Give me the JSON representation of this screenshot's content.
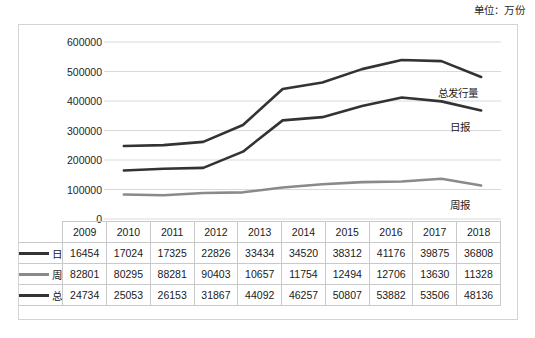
{
  "unit_note": "单位：万份",
  "chart_data": {
    "type": "line",
    "title": "",
    "xlabel": "",
    "ylabel": "",
    "ylim": [
      0,
      600000
    ],
    "ytick_step": 100000,
    "ytick_labels": [
      "600000",
      "500000",
      "400000",
      "300000",
      "200000",
      "100000",
      "0"
    ],
    "grid": true,
    "legend_position": "data-table-below",
    "unit": "万份",
    "categories": [
      "2009",
      "2010",
      "2011",
      "2012",
      "2013",
      "2014",
      "2015",
      "2016",
      "2017",
      "2018"
    ],
    "series": [
      {
        "name": "日报",
        "color": "#333333",
        "values": [
          16454,
          17024,
          17325,
          22826,
          33434,
          34520,
          38312,
          41176,
          39875,
          36808
        ],
        "plot_scale": 10,
        "inline_label": "日报"
      },
      {
        "name": "周报",
        "color": "#8a8a8a",
        "values": [
          82801,
          80295,
          88281,
          90403,
          10657,
          11754,
          12494,
          12706,
          13630,
          11328
        ],
        "plot_values": [
          8280,
          8029,
          8828,
          9040,
          10657,
          11754,
          12494,
          12706,
          13630,
          11328
        ],
        "plot_scale": 10,
        "inline_label": "周报"
      },
      {
        "name": "总和",
        "color": "#333333",
        "values": [
          24734,
          25053,
          26153,
          31867,
          44092,
          46257,
          50807,
          53882,
          53506,
          48136
        ],
        "plot_scale": 10,
        "inline_label": "总发行量"
      }
    ],
    "inline_labels": [
      {
        "text": "总发行量",
        "x_px": 437,
        "y_px": 84
      },
      {
        "text": "日报",
        "x_px": 449,
        "y_px": 118
      },
      {
        "text": "周报",
        "x_px": 449,
        "y_px": 196
      }
    ]
  },
  "table": {
    "corner": "",
    "header": [
      "2009",
      "2010",
      "2011",
      "2012",
      "2013",
      "2014",
      "2015",
      "2016",
      "2017",
      "2018"
    ],
    "rows": [
      {
        "label": "日报",
        "swatch": "dark",
        "cells": [
          "16454",
          "17024",
          "17325",
          "22826",
          "33434",
          "34520",
          "38312",
          "41176",
          "39875",
          "36808"
        ]
      },
      {
        "label": "周报",
        "swatch": "gray",
        "cells": [
          "82801",
          "80295",
          "88281",
          "90403",
          "10657",
          "11754",
          "12494",
          "12706",
          "13630",
          "11328"
        ]
      },
      {
        "label": "总和",
        "swatch": "dark",
        "cells": [
          "24734",
          "25053",
          "26153",
          "31867",
          "44092",
          "46257",
          "50807",
          "53882",
          "53506",
          "48136"
        ]
      }
    ]
  }
}
